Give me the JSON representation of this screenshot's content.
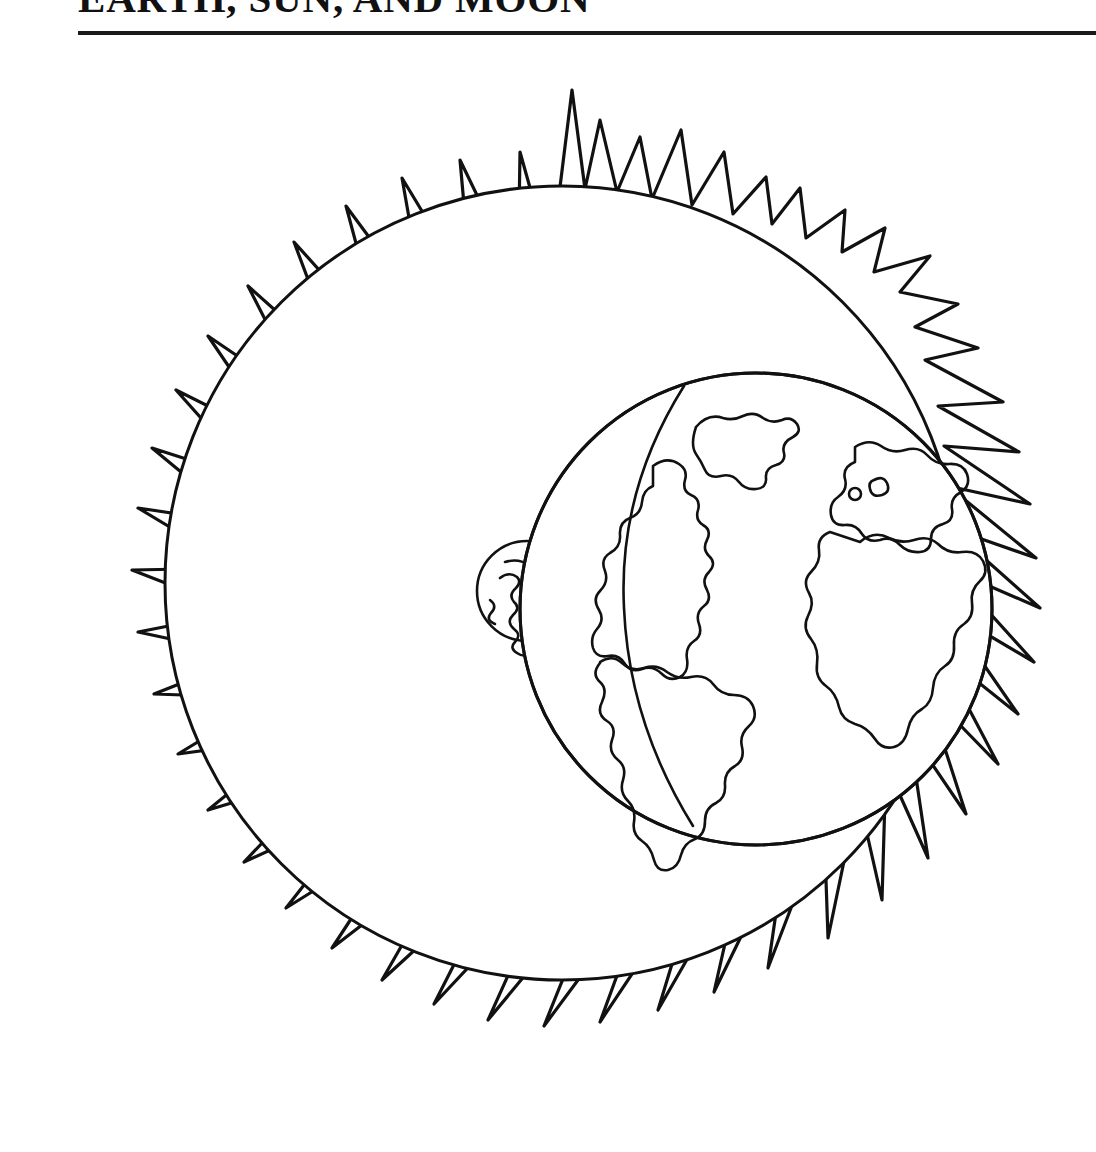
{
  "document": {
    "title": "EARTH, SUN, AND MOON",
    "kind": "line-art coloring page",
    "background_color": "#ffffff",
    "ink_color": "#111111"
  },
  "header": {
    "title": "EARTH, SUN, AND MOON",
    "rule_color": "#1a1a1a"
  },
  "figure": {
    "caption": "",
    "objects": [
      {
        "name": "sun",
        "label": "Sun",
        "shape": "circle with irregular flame rays",
        "center_x": 562,
        "center_y": 583,
        "radius": 397,
        "ray_count": 44,
        "fill": "#ffffff",
        "stroke": "#111111"
      },
      {
        "name": "earth",
        "label": "Earth",
        "shape": "globe with continent outlines",
        "center_x": 756,
        "center_y": 609,
        "radius": 236,
        "continents": [
          "North America",
          "South America",
          "Greenland",
          "Europe",
          "Africa"
        ],
        "fill": "#ffffff",
        "stroke": "#111111"
      },
      {
        "name": "moon",
        "label": "Moon",
        "shape": "small cratered circle behind Earth",
        "center_x": 527,
        "center_y": 591,
        "radius": 50,
        "fill": "#ffffff",
        "stroke": "#111111"
      }
    ]
  }
}
